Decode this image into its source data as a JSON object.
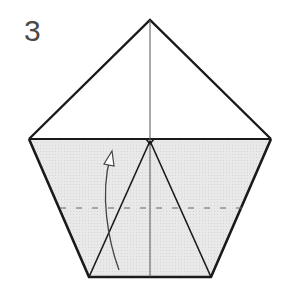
{
  "diagram": {
    "type": "origami-fold-step",
    "step_number": "3",
    "colors": {
      "paper_fill": "#e6e6e6",
      "outline": "#1a1a1a",
      "fold_line": "#555555",
      "dashed_line": "#666666",
      "arrow": "#444444"
    },
    "shapes": {
      "pentagon_outline": "150,20 271,139 211,277 89,277 29,139",
      "shaded_region": "29,139 150,139 271,139 211,277 89,277",
      "shoulder_line": {
        "x1": 29,
        "y1": 139,
        "x2": 271,
        "y2": 139
      },
      "center_crease": {
        "x1": 150,
        "y1": 20,
        "x2": 150,
        "y2": 277
      },
      "inner_left_edge": {
        "x1": 150,
        "y1": 141,
        "x2": 89,
        "y2": 277
      },
      "inner_right_edge": {
        "x1": 150,
        "y1": 141,
        "x2": 211,
        "y2": 277
      },
      "valley_fold_line": {
        "x1": 60,
        "y1": 208,
        "x2": 242,
        "y2": 208
      },
      "fold_arrow_path": "M 119 270 C 108 240, 100 195, 110 158"
    }
  }
}
